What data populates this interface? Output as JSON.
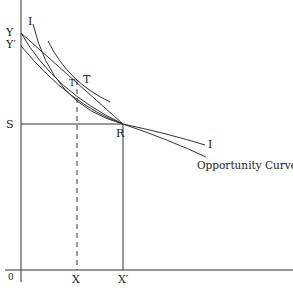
{
  "diagram": {
    "type": "economics-indifference-opportunity-curve",
    "colors": {
      "line": "#333333",
      "background": "#ffffff",
      "text": "#222222"
    },
    "axes": {
      "origin_label": "0",
      "y_labels": [
        "Y",
        "Y′"
      ],
      "x_labels": [
        "X",
        "X′"
      ]
    },
    "points": {
      "S": "S",
      "R": "R",
      "T": "T",
      "T_prime": "T′"
    },
    "curves": {
      "indifference_top_label": "I",
      "indifference_right_label": "I",
      "opportunity_curve_label": "Opportunity Curve"
    }
  }
}
